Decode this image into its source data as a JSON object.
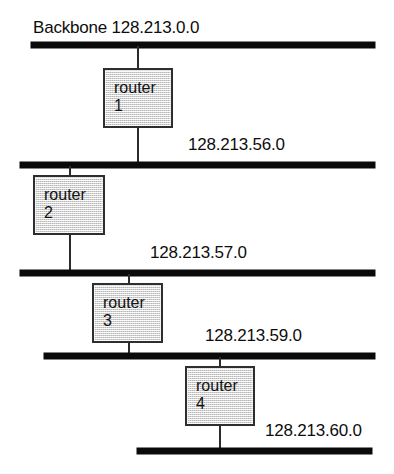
{
  "diagram": {
    "title": "Backbone 128.213.0.0",
    "segments": [
      {
        "id": "backbone",
        "label": "Backbone 128.213.0.0",
        "network": "128.213.0.0"
      },
      {
        "id": "seg-56",
        "label": "128.213.56.0",
        "network": "128.213.56.0"
      },
      {
        "id": "seg-57",
        "label": "128.213.57.0",
        "network": "128.213.57.0"
      },
      {
        "id": "seg-59",
        "label": "128.213.59.0",
        "network": "128.213.59.0"
      },
      {
        "id": "seg-60",
        "label": "128.213.60.0",
        "network": "128.213.60.0"
      }
    ],
    "routers": [
      {
        "id": "router-1",
        "name": "router",
        "number": "1",
        "connects": [
          "backbone",
          "seg-56"
        ]
      },
      {
        "id": "router-2",
        "name": "router",
        "number": "2",
        "connects": [
          "seg-56",
          "seg-57"
        ]
      },
      {
        "id": "router-3",
        "name": "router",
        "number": "3",
        "connects": [
          "seg-57",
          "seg-59"
        ]
      },
      {
        "id": "router-4",
        "name": "router",
        "number": "4",
        "connects": [
          "seg-59",
          "seg-60"
        ]
      }
    ],
    "colors": {
      "bus": "#0a0a0a",
      "box_border": "#2e2e2e",
      "box_fill": "#e3e3e3",
      "text": "#0d0d0d",
      "background": "#ffffff"
    }
  }
}
